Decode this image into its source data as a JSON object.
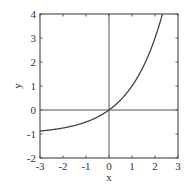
{
  "chart_data": {
    "type": "line",
    "title": "",
    "xlabel": "x",
    "ylabel": "y",
    "xlim": [
      -3,
      3
    ],
    "ylim": [
      -2,
      4
    ],
    "xticks": [
      -3,
      -2,
      -1,
      0,
      1,
      2,
      3
    ],
    "yticks": [
      -2,
      -1,
      0,
      1,
      2,
      3,
      4
    ],
    "xtick_labels": [
      "-3",
      "-2",
      "-1",
      "0",
      "1",
      "2",
      "3"
    ],
    "ytick_labels": [
      "-2",
      "-1",
      "0",
      "1",
      "2",
      "3",
      "4"
    ],
    "grid": false,
    "legend": null,
    "reference_lines": [
      {
        "orientation": "horizontal",
        "value": 0
      },
      {
        "orientation": "vertical",
        "value": 0
      }
    ],
    "series": [
      {
        "name": "y = 2^x - 1",
        "x": [
          -3,
          -2.5,
          -2,
          -1.5,
          -1,
          -0.5,
          0,
          0.5,
          1,
          1.5,
          2,
          2.32
        ],
        "y": [
          -0.875,
          -0.823,
          -0.75,
          -0.646,
          -0.5,
          -0.293,
          0,
          0.414,
          1,
          1.828,
          3,
          4.0
        ]
      }
    ]
  },
  "colors": {
    "axis": "#555555",
    "curve": "#444444",
    "text": "#333333"
  }
}
